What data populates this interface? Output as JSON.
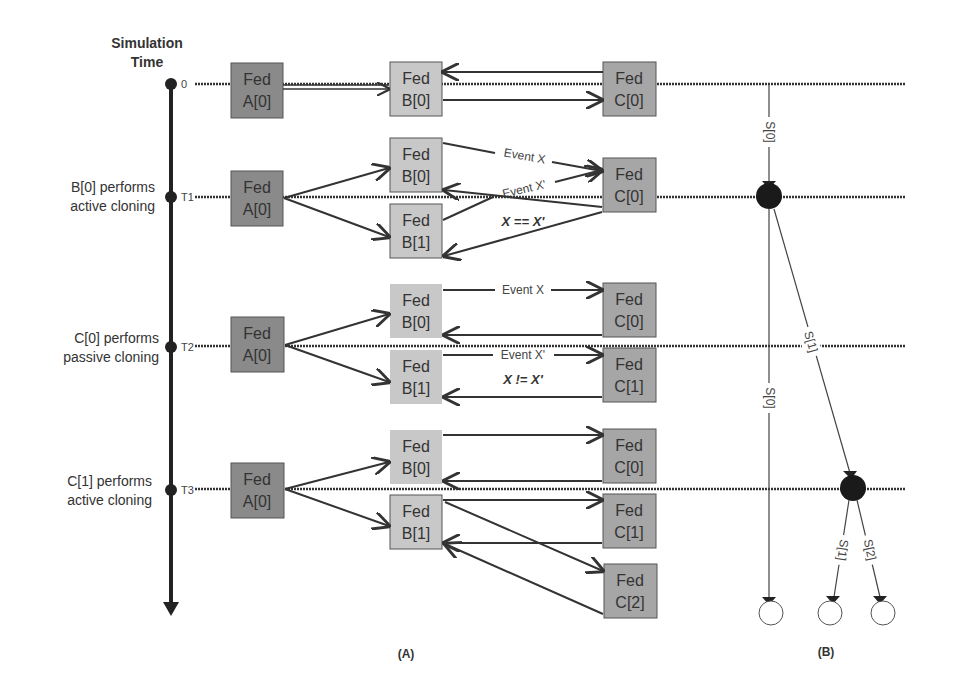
{
  "timeline": {
    "title_line1": "Simulation",
    "title_line2": "Time",
    "ticks": [
      "0",
      "T1",
      "T2",
      "T3"
    ],
    "events": [
      {
        "line1": "",
        "line2": ""
      },
      {
        "line1": "B[0] performs",
        "line2": "active cloning"
      },
      {
        "line1": "C[0] performs",
        "line2": "passive cloning"
      },
      {
        "line1": "C[1] performs",
        "line2": "active cloning"
      }
    ]
  },
  "feds": {
    "prefix": "Fed",
    "a0": "A[0]",
    "b0": "B[0]",
    "b1": "B[1]",
    "c0": "C[0]",
    "c1": "C[1]",
    "c2": "C[2]"
  },
  "messages": {
    "event_x": "Event X",
    "event_x_prime": "Event X'",
    "equal": "X == X'",
    "not_equal": "X != X'"
  },
  "tree": {
    "s0": "S[0]",
    "s1": "S[1]",
    "s2": "S[2]"
  },
  "panels": {
    "a": "(A)",
    "b": "(B)"
  },
  "colors": {
    "fed_a": "#8a8a8a",
    "fed_b": "#c8c8c8",
    "fed_c": "#a6a6a6",
    "line": "#333333"
  }
}
